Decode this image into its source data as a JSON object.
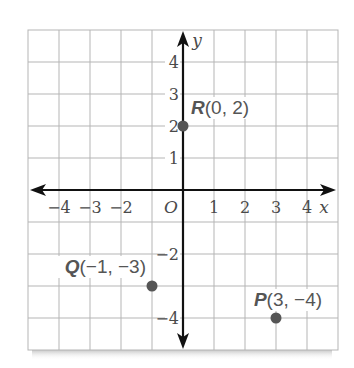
{
  "chart_data": {
    "type": "scatter",
    "title": "",
    "xlabel": "x",
    "ylabel": "y",
    "origin_label": "O",
    "xlim": [
      -5,
      5
    ],
    "ylim": [
      -5,
      5
    ],
    "grid": true,
    "x_ticks": [
      {
        "value": -4,
        "label": "−4"
      },
      {
        "value": -3,
        "label": "−3"
      },
      {
        "value": -2,
        "label": "−2"
      },
      {
        "value": 1,
        "label": "1"
      },
      {
        "value": 2,
        "label": "2"
      },
      {
        "value": 3,
        "label": "3"
      },
      {
        "value": 4,
        "label": "4"
      }
    ],
    "y_ticks": [
      {
        "value": 4,
        "label": "4"
      },
      {
        "value": 3,
        "label": "3"
      },
      {
        "value": 2,
        "label": "2"
      },
      {
        "value": 1,
        "label": "1"
      },
      {
        "value": -2,
        "label": "−2"
      },
      {
        "value": -4,
        "label": "−4"
      }
    ],
    "points": [
      {
        "name": "R",
        "x": 0,
        "y": 2,
        "coords": "(0, 2)"
      },
      {
        "name": "Q",
        "x": -1,
        "y": -3,
        "coords": "(−1, −3)"
      },
      {
        "name": "P",
        "x": 3,
        "y": -4,
        "coords": "(3, −4)"
      }
    ]
  },
  "colors": {
    "grid": "#b5b5b5",
    "axis": "#111111",
    "point": "#555555",
    "text": "#4a4a4a"
  }
}
